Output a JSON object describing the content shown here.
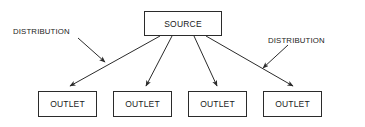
{
  "diagram": {
    "type": "flow-diagram",
    "colors": {
      "stroke": "#2b2b2b",
      "text": "#1a1a1a",
      "background": "#ffffff"
    },
    "source_node": {
      "label": "SOURCE",
      "shape": "rectangle"
    },
    "outlet_nodes": [
      {
        "label": "OUTLET",
        "shape": "rectangle"
      },
      {
        "label": "OUTLET",
        "shape": "rectangle"
      },
      {
        "label": "OUTLET",
        "shape": "rectangle"
      },
      {
        "label": "OUTLET",
        "shape": "rectangle"
      }
    ],
    "edge_labels": [
      {
        "label": "DISTRIBUTION",
        "position": "left"
      },
      {
        "label": "DISTRIBUTION",
        "position": "right"
      }
    ],
    "connections": [
      {
        "from": "SOURCE",
        "to": "OUTLET",
        "index": 1,
        "arrow": "filled"
      },
      {
        "from": "SOURCE",
        "to": "OUTLET",
        "index": 2,
        "arrow": "filled"
      },
      {
        "from": "SOURCE",
        "to": "OUTLET",
        "index": 3,
        "arrow": "filled"
      },
      {
        "from": "SOURCE",
        "to": "OUTLET",
        "index": 4,
        "arrow": "filled"
      },
      {
        "from": "DISTRIBUTION",
        "to": "edge",
        "position": "left",
        "arrow": "filled"
      },
      {
        "from": "DISTRIBUTION",
        "to": "edge",
        "position": "right",
        "arrow": "filled"
      }
    ]
  }
}
